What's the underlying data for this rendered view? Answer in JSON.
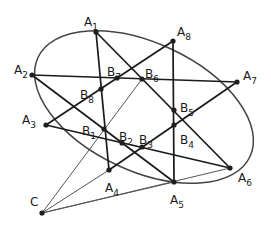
{
  "diagram": {
    "type": "geometry",
    "ellipse": {
      "cx": 144,
      "cy": 107,
      "rx": 117,
      "ry": 64,
      "rotation": 25
    },
    "points": [
      {
        "id": "A1",
        "label": "A",
        "sub": "1",
        "x": 96,
        "y": 32,
        "lx": 84,
        "ly": 22
      },
      {
        "id": "A2",
        "label": "A",
        "sub": "2",
        "x": 32,
        "y": 75,
        "lx": 14,
        "ly": 70
      },
      {
        "id": "A3",
        "label": "A",
        "sub": "3",
        "x": 46,
        "y": 125,
        "lx": 22,
        "ly": 120
      },
      {
        "id": "A4",
        "label": "A",
        "sub": "4",
        "x": 109,
        "y": 170,
        "lx": 105,
        "ly": 188
      },
      {
        "id": "A5",
        "label": "A",
        "sub": "5",
        "x": 174,
        "y": 182,
        "lx": 170,
        "ly": 200
      },
      {
        "id": "A6",
        "label": "A",
        "sub": "6",
        "x": 230,
        "y": 168,
        "lx": 238,
        "ly": 178
      },
      {
        "id": "A7",
        "label": "A",
        "sub": "7",
        "x": 237,
        "y": 82,
        "lx": 243,
        "ly": 76
      },
      {
        "id": "A8",
        "label": "A",
        "sub": "8",
        "x": 173,
        "y": 41,
        "lx": 177,
        "ly": 32
      },
      {
        "id": "B1",
        "label": "B",
        "sub": "1",
        "x": 104,
        "y": 129,
        "lx": 82,
        "ly": 131
      },
      {
        "id": "B2",
        "label": "B",
        "sub": "2",
        "x": 122,
        "y": 143,
        "lx": 119,
        "ly": 137
      },
      {
        "id": "B3",
        "label": "B",
        "sub": "3",
        "x": 142,
        "y": 147,
        "lx": 139,
        "ly": 140
      },
      {
        "id": "B4",
        "label": "B",
        "sub": "4",
        "x": 174,
        "y": 125,
        "lx": 180,
        "ly": 140
      },
      {
        "id": "B5",
        "label": "B",
        "sub": "5",
        "x": 174,
        "y": 110,
        "lx": 180,
        "ly": 108
      },
      {
        "id": "B6",
        "label": "B",
        "sub": "6",
        "x": 142,
        "y": 79,
        "lx": 145,
        "ly": 74
      },
      {
        "id": "B7",
        "label": "B",
        "sub": "7",
        "x": 117,
        "y": 78,
        "lx": 107,
        "ly": 72
      },
      {
        "id": "B8",
        "label": "B",
        "sub": "8",
        "x": 101,
        "y": 89,
        "lx": 80,
        "ly": 95
      },
      {
        "id": "C",
        "label": "C",
        "sub": "",
        "x": 42,
        "y": 213,
        "lx": 30,
        "ly": 202
      }
    ],
    "chords": [
      [
        "A1",
        "A4"
      ],
      [
        "A1",
        "A6"
      ],
      [
        "A2",
        "A7"
      ],
      [
        "A2",
        "A5"
      ],
      [
        "A3",
        "A8"
      ],
      [
        "A3",
        "A6"
      ],
      [
        "A8",
        "A5"
      ],
      [
        "A4",
        "A7"
      ]
    ],
    "thin_lines": [
      [
        "C",
        "A4"
      ],
      [
        "C",
        "A5"
      ],
      [
        "C",
        "A6"
      ],
      [
        "C",
        "B6"
      ]
    ],
    "colors": {
      "stroke": "#1a1a1a",
      "ellipse": "#444444",
      "thin": "#555555",
      "background": "#ffffff"
    }
  }
}
